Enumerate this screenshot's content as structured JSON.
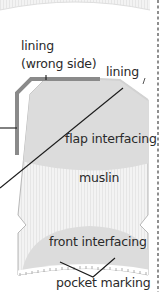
{
  "diagram": {
    "labels": {
      "lining_wrong_side_line1": "lining",
      "lining_wrong_side_line2": "(wrong side)",
      "lining": "lining",
      "flap_interfacing": "flap interfacing",
      "muslin": "muslin",
      "front_interfacing": "front interfacing",
      "pocket_marking": "pocket marking"
    },
    "colors": {
      "muslin": "#f1f1f1",
      "muslin_stripe": "#e4e4e4",
      "interfacing": "#dcdcdc",
      "lining_edge": "#8a8a8a",
      "outline": "#b5b5b5",
      "leader_line": "#1a1a1a",
      "fold_line": "#444444",
      "text": "#2a2a2a"
    }
  }
}
